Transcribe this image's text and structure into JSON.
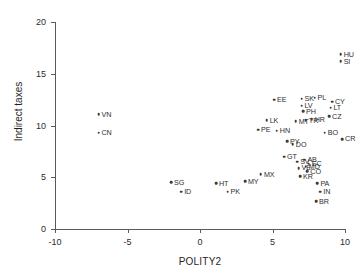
{
  "chart_data": {
    "type": "scatter",
    "title": "",
    "xlabel": "POLITY2",
    "ylabel": "Indirect taxes",
    "xlim": [
      -10,
      10
    ],
    "ylim": [
      0,
      20
    ],
    "xticks": [
      -10,
      -5,
      0,
      5,
      10
    ],
    "yticks": [
      0,
      5,
      10,
      15,
      20
    ],
    "xtick_labels": [
      "-10",
      "-5",
      "0",
      "5",
      "10"
    ],
    "ytick_labels": [
      "0",
      "5",
      "10",
      "15",
      "20"
    ],
    "grid": false,
    "legend": "none",
    "marker_color": "#3c3c3c",
    "axis_color": "#5a5a5a",
    "points": [
      {
        "label": "VN",
        "x": -7.0,
        "y": 11.1
      },
      {
        "label": "CN",
        "x": -7.0,
        "y": 9.3
      },
      {
        "label": "SG",
        "x": -2.0,
        "y": 4.5
      },
      {
        "label": "ID",
        "x": -1.3,
        "y": 3.6
      },
      {
        "label": "HT",
        "x": 1.1,
        "y": 4.4
      },
      {
        "label": "PK",
        "x": 1.9,
        "y": 3.6
      },
      {
        "label": "MY",
        "x": 3.1,
        "y": 4.6
      },
      {
        "label": "MX",
        "x": 4.2,
        "y": 5.3
      },
      {
        "label": "EE",
        "x": 5.1,
        "y": 12.5
      },
      {
        "label": "LK",
        "x": 4.6,
        "y": 10.5
      },
      {
        "label": "PE",
        "x": 4.0,
        "y": 9.6
      },
      {
        "label": "HN",
        "x": 5.3,
        "y": 9.5
      },
      {
        "label": "PY",
        "x": 6.0,
        "y": 8.5
      },
      {
        "label": "DO",
        "x": 6.4,
        "y": 8.2
      },
      {
        "label": "GT",
        "x": 5.8,
        "y": 7.0
      },
      {
        "label": "SV",
        "x": 6.7,
        "y": 6.5
      },
      {
        "label": "AB",
        "x": 7.2,
        "y": 6.7
      },
      {
        "label": "EC",
        "x": 7.5,
        "y": 6.3
      },
      {
        "label": "VE",
        "x": 6.8,
        "y": 5.9
      },
      {
        "label": "MD",
        "x": 7.3,
        "y": 6.0
      },
      {
        "label": "CO",
        "x": 7.4,
        "y": 5.6
      },
      {
        "label": "KR",
        "x": 6.9,
        "y": 5.1
      },
      {
        "label": "PA",
        "x": 8.1,
        "y": 4.4
      },
      {
        "label": "IN",
        "x": 8.3,
        "y": 3.6
      },
      {
        "label": "BR",
        "x": 8.0,
        "y": 2.7
      },
      {
        "label": "MT",
        "x": 6.6,
        "y": 10.4
      },
      {
        "label": "TR",
        "x": 7.3,
        "y": 10.5
      },
      {
        "label": "HR",
        "x": 7.7,
        "y": 10.6
      },
      {
        "label": "SK",
        "x": 7.0,
        "y": 12.6
      },
      {
        "label": "PL",
        "x": 7.9,
        "y": 12.7
      },
      {
        "label": "LV",
        "x": 7.0,
        "y": 11.9
      },
      {
        "label": "PH",
        "x": 7.1,
        "y": 11.4
      },
      {
        "label": "CY",
        "x": 9.1,
        "y": 12.3
      },
      {
        "label": "LT",
        "x": 9.0,
        "y": 11.7
      },
      {
        "label": "CZ",
        "x": 8.9,
        "y": 10.9
      },
      {
        "label": "HU",
        "x": 9.7,
        "y": 16.9
      },
      {
        "label": "SI",
        "x": 9.7,
        "y": 16.2
      },
      {
        "label": "BO",
        "x": 8.6,
        "y": 9.3
      },
      {
        "label": "CR",
        "x": 9.8,
        "y": 8.7
      }
    ]
  },
  "axes": {
    "x_title": "POLITY2",
    "y_title": "Indirect taxes"
  }
}
